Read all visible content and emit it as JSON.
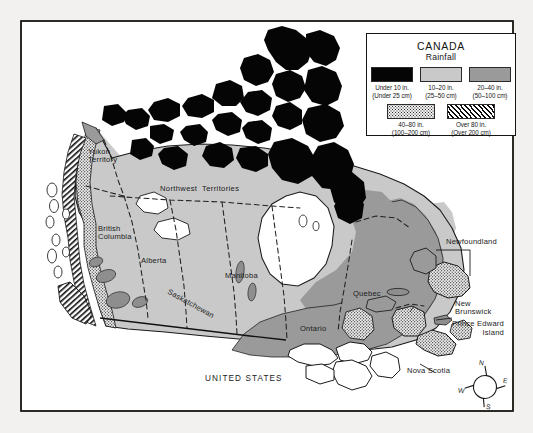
{
  "map": {
    "title": "Canada Rainfall Map",
    "country_label": "UNITED STATES",
    "provinces": [
      {
        "name": "Yukon Territory",
        "line1": "Yukon",
        "line2": "Territory"
      },
      {
        "name": "Northwest Territories",
        "label": "Northwest  Territories"
      },
      {
        "name": "British Columbia",
        "line1": "British",
        "line2": "Columbia"
      },
      {
        "name": "Alberta",
        "label": "Alberta"
      },
      {
        "name": "Saskatchewan",
        "label": "Saskatchewan"
      },
      {
        "name": "Manitoba",
        "label": "Manitoba"
      },
      {
        "name": "Ontario",
        "label": "Ontario"
      },
      {
        "name": "Quebec",
        "label": "Quebec"
      },
      {
        "name": "Newfoundland",
        "label": "Newfoundland"
      },
      {
        "name": "New Brunswick",
        "line1": "New",
        "line2": "Brunswick"
      },
      {
        "name": "Prince Edward Island",
        "line1": "Prince Edward",
        "line2": "Island"
      },
      {
        "name": "Nova Scotia",
        "label": "Nova Scotia"
      }
    ]
  },
  "legend": {
    "title": "CANADA",
    "subtitle": "Rainfall",
    "entries": [
      {
        "swatch": "black",
        "inches": "Under 10 in.",
        "metric": "(Under 25 cm)"
      },
      {
        "swatch": "lightgray",
        "inches": "10–20 in.",
        "metric": "(25–50 cm)"
      },
      {
        "swatch": "midgray",
        "inches": "20–40 in.",
        "metric": "(50–100 cm)"
      },
      {
        "swatch": "stipple",
        "inches": "40–80 in.",
        "metric": "(100–200 cm)"
      },
      {
        "swatch": "hatch",
        "inches": "Over 80 in.",
        "metric": "(Over 200 cm)"
      }
    ]
  },
  "compass": {
    "north": "N",
    "east": "E",
    "south": "S",
    "west": "W"
  },
  "colors": {
    "black": "#050505",
    "light_gray": "#c9c9c9",
    "mid_gray": "#9a9a9a",
    "frame": "#15150f",
    "page_background": "#f2f1ef",
    "water": "#ffffff"
  }
}
